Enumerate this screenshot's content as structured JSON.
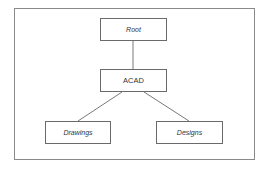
{
  "diagram": {
    "type": "tree",
    "nodes": [
      {
        "id": "root",
        "label": "Root",
        "italic": true
      },
      {
        "id": "acad",
        "label": "ACAD",
        "italic": false
      },
      {
        "id": "drawings",
        "label": "Drawings",
        "italic": true
      },
      {
        "id": "designs",
        "label": "Designs",
        "italic": true
      }
    ],
    "edges": [
      {
        "from": "root",
        "to": "acad"
      },
      {
        "from": "acad",
        "to": "drawings"
      },
      {
        "from": "acad",
        "to": "designs"
      }
    ]
  }
}
